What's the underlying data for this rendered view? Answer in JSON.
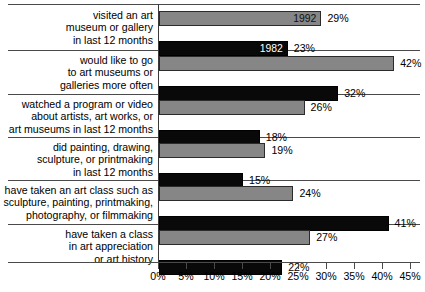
{
  "chart_data": {
    "type": "bar",
    "orientation": "horizontal",
    "title": "",
    "xlabel": "",
    "ylabel": "",
    "xlim": [
      0,
      45
    ],
    "xticks": [
      "0%",
      "5%",
      "10%",
      "15%",
      "20%",
      "25%",
      "30%",
      "35%",
      "40%",
      "45%"
    ],
    "xtick_values": [
      0,
      5,
      10,
      15,
      20,
      25,
      30,
      35,
      40,
      45
    ],
    "grid": false,
    "legend": "inline-bar-labels",
    "series": [
      {
        "name": "1992",
        "color": "#868686",
        "values": [
          29,
          42,
          26,
          19,
          24,
          27
        ]
      },
      {
        "name": "1982",
        "color": "#090909",
        "values": [
          23,
          32,
          18,
          15,
          41,
          22
        ]
      }
    ],
    "categories": [
      "visited an art museum or gallery in last 12 months",
      "would like to go to art museums or galleries more often",
      "watched a program or video about artists, art works, or art museums in last 12 months",
      "did painting, drawing, sculpture, or printmaking in last 12 months",
      "have taken an art class such as sculpture, painting, printmaking, photography, or filmmaking",
      "have taken a class in art appreciation or art history"
    ],
    "rows": [
      {
        "label_lines": [
          "visited an art",
          "museum or gallery",
          "in last 12 months"
        ],
        "bars": [
          {
            "series": "1992",
            "value": 29,
            "value_label": "29%",
            "inline_label": "1992"
          },
          {
            "series": "1982",
            "value": 23,
            "value_label": "23%",
            "inline_label": "1982"
          }
        ]
      },
      {
        "label_lines": [
          "would like to go",
          "to art museums or",
          "galleries more often"
        ],
        "bars": [
          {
            "series": "1992",
            "value": 42,
            "value_label": "42%",
            "inline_label": ""
          },
          {
            "series": "1982",
            "value": 32,
            "value_label": "32%",
            "inline_label": ""
          }
        ]
      },
      {
        "label_lines": [
          "watched a program or video",
          "about artists, art works, or",
          "art museums in last 12 months"
        ],
        "bars": [
          {
            "series": "1992",
            "value": 26,
            "value_label": "26%",
            "inline_label": ""
          },
          {
            "series": "1982",
            "value": 18,
            "value_label": "18%",
            "inline_label": ""
          }
        ]
      },
      {
        "label_lines": [
          "did painting, drawing,",
          "sculpture, or printmaking",
          "in last 12 months"
        ],
        "bars": [
          {
            "series": "1992",
            "value": 19,
            "value_label": "19%",
            "inline_label": ""
          },
          {
            "series": "1982",
            "value": 15,
            "value_label": "15%",
            "inline_label": ""
          }
        ]
      },
      {
        "label_lines": [
          "have taken an art class such as",
          "sculpture, painting, printmaking,",
          "photography, or filmmaking"
        ],
        "bars": [
          {
            "series": "1992",
            "value": 24,
            "value_label": "24%",
            "inline_label": ""
          },
          {
            "series": "1982",
            "value": 41,
            "value_label": "41%",
            "inline_label": ""
          }
        ]
      },
      {
        "label_lines": [
          "have taken a class",
          "in art appreciation",
          "or art history"
        ],
        "bars": [
          {
            "series": "1992",
            "value": 27,
            "value_label": "27%",
            "inline_label": ""
          },
          {
            "series": "1982",
            "value": 22,
            "value_label": "22%",
            "inline_label": ""
          }
        ]
      }
    ]
  },
  "layout": {
    "plot_left_px": 159,
    "px_per_percent": 5.6,
    "row_tops": [
      8,
      61,
      104,
      147,
      190,
      233
    ],
    "separator_tops": [
      4,
      50,
      94,
      137,
      180,
      224,
      258
    ],
    "bar_height_px": 15
  }
}
